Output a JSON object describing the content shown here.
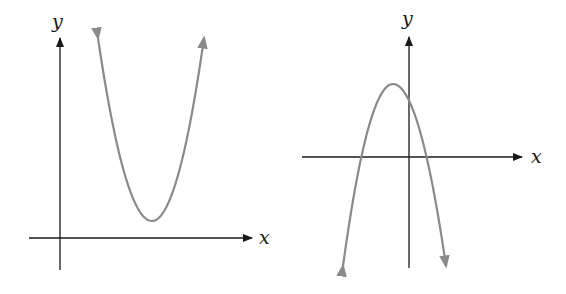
{
  "colors": {
    "background": "#ffffff",
    "axis": "#1a1a1a",
    "curve": "#8a8a8a"
  },
  "graphs": [
    {
      "id": "left",
      "description": "Upward-opening parabola entirely above the x-axis (no real roots), vertex in first quadrant",
      "x_label": "x",
      "y_label": "y",
      "x_axis": {
        "y": 238,
        "x1": 29,
        "x2": 252
      },
      "y_axis": {
        "x": 60,
        "y1": 270,
        "y2": 38
      },
      "x_label_pos": {
        "x": 259,
        "y": 244
      },
      "y_label_pos": {
        "x": 52,
        "y": 28
      },
      "curve": {
        "opens": "up",
        "vertex": {
          "x": 152,
          "y": 221
        },
        "left_tip": {
          "x": 98,
          "y": 38
        },
        "right_tip": {
          "x": 204,
          "y": 38
        }
      }
    },
    {
      "id": "right",
      "description": "Downward-opening parabola crossing x-axis twice, vertex slightly left of y-axis above x-axis",
      "x_label": "x",
      "y_label": "y",
      "x_axis": {
        "y": 157,
        "x1": 302,
        "x2": 522
      },
      "y_axis": {
        "x": 409,
        "y1": 268,
        "y2": 37
      },
      "x_label_pos": {
        "x": 531,
        "y": 163
      },
      "y_label_pos": {
        "x": 402,
        "y": 25
      },
      "curve": {
        "opens": "down",
        "vertex": {
          "x": 393,
          "y": 84
        },
        "roots_px": [
          361,
          426
        ],
        "left_tip": {
          "x": 343,
          "y": 266
        },
        "right_tip": {
          "x": 446,
          "y": 266
        }
      }
    }
  ]
}
